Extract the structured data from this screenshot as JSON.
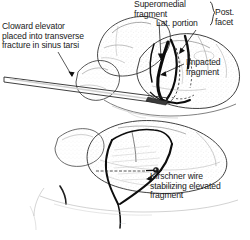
{
  "figure": {
    "background_color": "#ffffff",
    "ink_color": "#111111",
    "width": 250,
    "height": 240
  },
  "labels": {
    "cloward": "Cloward elevator\nplaced into transverse\nfracture in sinus tarsi",
    "superomedial": "Superomedial\nfragment",
    "lateral_portion": "Lat. portion",
    "posterior_facet": "Post.\nfacet",
    "impacted": "Impacted\nfragment",
    "kirschner": "Kirschner wire\nstabilizing elevated\nfragment"
  },
  "signature": "artist signature",
  "panels": [
    {
      "name": "upper-panel",
      "description": "Lateral view of calcaneus with Cloward elevator inserted into transverse fracture of sinus tarsi, showing superomedial fragment, lateral portion of posterior facet and impacted fragment"
    },
    {
      "name": "lower-panel",
      "description": "Calcaneus after elevation of depressed fragment, stabilized with a Kirschner wire"
    }
  ],
  "annotations": [
    {
      "name": "leader-cloward",
      "target": "elevator-shaft"
    },
    {
      "name": "leader-superomedial",
      "target": "superomedial-fragment"
    },
    {
      "name": "leader-lateral-portion",
      "target": "lateral-portion"
    },
    {
      "name": "brace-posterior-facet",
      "target": "posterior-facet-group"
    },
    {
      "name": "leader-impacted",
      "target": "impacted-fragment"
    },
    {
      "name": "leader-kirschner",
      "target": "kirschner-wire"
    }
  ]
}
